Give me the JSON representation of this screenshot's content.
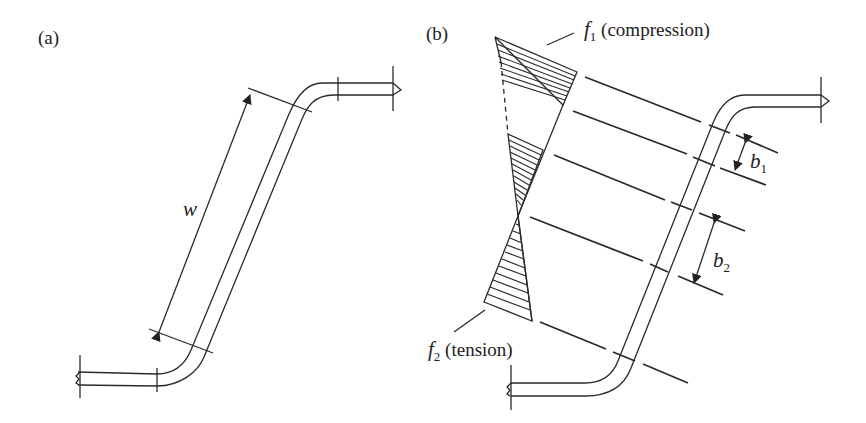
{
  "panels": [
    {
      "id": "a",
      "label": "(a)",
      "dimension_label": "w"
    },
    {
      "id": "b",
      "label": "(b)",
      "stress_labels": {
        "f1_symbol": "f",
        "f1_sub": "1",
        "f1_text": " (compression)",
        "f2_symbol": "f",
        "f2_sub": "2",
        "f2_text": " (tension)"
      },
      "dimension_labels": {
        "b1_symbol": "b",
        "b1_sub": "1",
        "b2_symbol": "b",
        "b2_sub": "2"
      }
    }
  ],
  "colors": {
    "line": "#2a2a2a",
    "background": "#ffffff"
  }
}
